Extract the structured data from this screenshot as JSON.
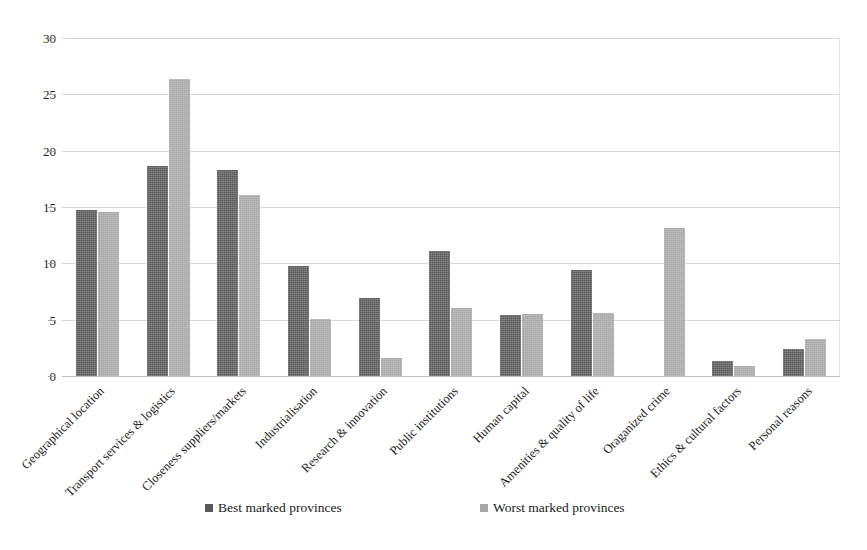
{
  "chart_data": {
    "type": "bar",
    "title": "",
    "subtitle": "",
    "xlabel": "",
    "ylabel": "",
    "ylim": [
      0,
      30
    ],
    "ytick_values": [
      0,
      5,
      10,
      15,
      20,
      25,
      30
    ],
    "ytick_labels": [
      "0",
      "5",
      "10",
      "15",
      "20",
      "25",
      "30"
    ],
    "grid": true,
    "grid_axis": "y",
    "legend_position": "bottom",
    "categories": [
      "Geographical location",
      "Transport services & logistics",
      "Closeness suppliers/markets",
      "Industrialisation",
      "Research & innovation",
      "Public institutions",
      "Human capital",
      "Amenities & quality of life",
      "Oraganized crime",
      "Ethics & cultural factors",
      "Personal reasons"
    ],
    "series": [
      {
        "name": "Best marked provinces",
        "color": "#595959",
        "values": [
          14.7,
          18.6,
          18.3,
          9.8,
          6.9,
          11.1,
          5.4,
          9.4,
          0,
          1.3,
          2.4
        ]
      },
      {
        "name": "Worst marked provinces",
        "color": "#a6a6a6",
        "values": [
          14.6,
          26.4,
          16.1,
          5.1,
          1.6,
          6.0,
          5.5,
          5.6,
          13.1,
          0.9,
          3.3
        ]
      }
    ]
  },
  "legend": {
    "items": [
      {
        "label": "Best marked provinces",
        "color": "#595959"
      },
      {
        "label": "Worst marked provinces",
        "color": "#a6a6a6"
      }
    ]
  }
}
